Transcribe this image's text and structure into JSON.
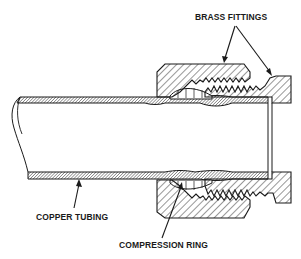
{
  "labels": {
    "brass_fittings": "BRASS FITTINGS",
    "copper_tubing": "COPPER TUBING",
    "compression_ring": "COMPRESSION RING"
  },
  "colors": {
    "ink": "#1a1a1a",
    "background": "#ffffff"
  }
}
